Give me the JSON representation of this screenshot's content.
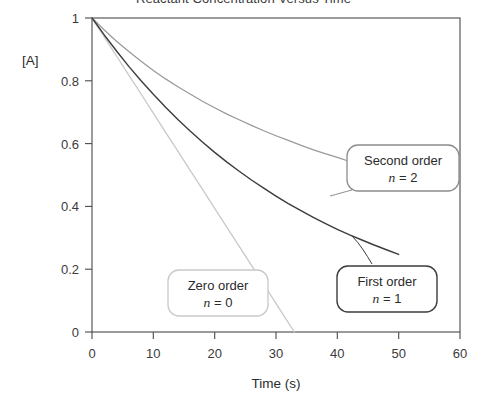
{
  "chart_data": {
    "type": "line",
    "title": "Reactant Concentration Versus Time",
    "xlabel": "Time (s)",
    "ylabel": "[A]",
    "xlim": [
      0,
      60
    ],
    "ylim": [
      0,
      1
    ],
    "xticks": [
      "0",
      "10",
      "20",
      "30",
      "40",
      "50",
      "60"
    ],
    "yticks": [
      "0",
      "0.2",
      "0.4",
      "0.6",
      "0.8",
      "1"
    ],
    "xtick_values": [
      0,
      10,
      20,
      30,
      40,
      50,
      60
    ],
    "ytick_values": [
      0,
      0.2,
      0.4,
      0.6,
      0.8,
      1
    ],
    "grid": false,
    "legend": "annotated-callouts",
    "series": [
      {
        "name": "Zero order",
        "order_label": "n = 0",
        "n": 0,
        "color": "#c9c9c9",
        "x": [
          0,
          2,
          4,
          6,
          8,
          10,
          12,
          14,
          16,
          18,
          20,
          22,
          24,
          26,
          28,
          30,
          32,
          33
        ],
        "values": [
          1.0,
          0.939,
          0.879,
          0.818,
          0.758,
          0.697,
          0.636,
          0.576,
          0.515,
          0.455,
          0.394,
          0.333,
          0.273,
          0.212,
          0.152,
          0.091,
          0.03,
          0.0
        ]
      },
      {
        "name": "First order",
        "order_label": "n = 1",
        "n": 1,
        "color": "#3c3c3c",
        "x": [
          0,
          2,
          4,
          6,
          8,
          10,
          12,
          14,
          16,
          18,
          20,
          22,
          24,
          26,
          28,
          30,
          32,
          34,
          36,
          38,
          40,
          42,
          44,
          46,
          48,
          50
        ],
        "values": [
          1.0,
          0.946,
          0.895,
          0.846,
          0.8,
          0.757,
          0.716,
          0.677,
          0.64,
          0.605,
          0.572,
          0.541,
          0.512,
          0.484,
          0.458,
          0.433,
          0.409,
          0.387,
          0.366,
          0.346,
          0.327,
          0.309,
          0.293,
          0.277,
          0.262,
          0.247
        ]
      },
      {
        "name": "Second order",
        "order_label": "n = 2",
        "n": 2,
        "color": "#9a9a9a",
        "x": [
          0,
          2,
          4,
          6,
          8,
          10,
          12,
          14,
          16,
          18,
          20,
          22,
          24,
          26,
          28,
          30,
          32,
          34,
          36,
          38,
          40,
          42,
          44,
          46,
          48,
          50
        ],
        "values": [
          1.0,
          0.962,
          0.926,
          0.893,
          0.862,
          0.833,
          0.806,
          0.781,
          0.758,
          0.735,
          0.714,
          0.694,
          0.676,
          0.658,
          0.641,
          0.625,
          0.61,
          0.595,
          0.581,
          0.568,
          0.556,
          0.543,
          0.532,
          0.521,
          0.51,
          0.5
        ]
      }
    ],
    "annotations": [
      {
        "id": "zero-order",
        "line1": "Zero order",
        "line2_prefix": "n",
        "line2_rest": " = 0",
        "border_color": "#c9c9c9"
      },
      {
        "id": "first-order",
        "line1": "First order",
        "line2_prefix": "n",
        "line2_rest": " = 1",
        "border_color": "#3c3c3c"
      },
      {
        "id": "second-order",
        "line1": "Second order",
        "line2_prefix": "n",
        "line2_rest": " = 2",
        "border_color": "#8c8c8c"
      }
    ]
  }
}
